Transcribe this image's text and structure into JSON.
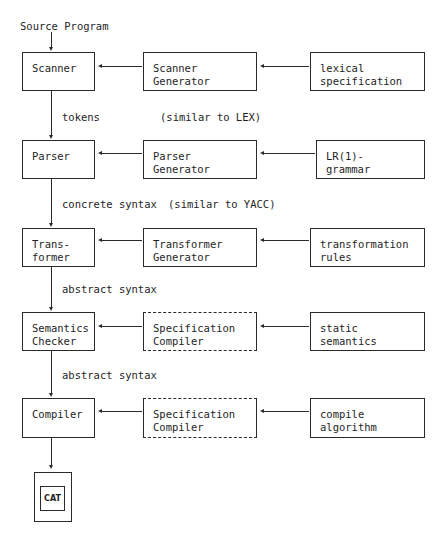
{
  "diagram": {
    "input_label": "Source Program",
    "rows": [
      {
        "stage": "Scanner",
        "generator": "Scanner\nGenerator",
        "generator_style": "solid",
        "spec": "lexical\nspecification",
        "edge_label": "tokens",
        "note": "(similar to LEX)"
      },
      {
        "stage": "Parser",
        "generator": "Parser\nGenerator",
        "generator_style": "solid",
        "spec": "LR(1)-\ngrammar",
        "edge_label": "concrete syntax",
        "note": "(similar to YACC)"
      },
      {
        "stage": "Trans-\nformer",
        "generator": "Transformer\nGenerator",
        "generator_style": "solid",
        "spec": "transformation\nrules",
        "edge_label": "abstract syntax",
        "note": ""
      },
      {
        "stage": "Semantics\nChecker",
        "generator": "Specification\nCompiler",
        "generator_style": "dashed",
        "spec": "static\nsemantics",
        "edge_label": "abstract syntax",
        "note": ""
      },
      {
        "stage": "Compiler",
        "generator": "Specification\nCompiler",
        "generator_style": "dashed",
        "spec": "compile\nalgorithm",
        "edge_label": "",
        "note": ""
      }
    ],
    "output": {
      "label": "CAT"
    },
    "colors": {
      "line": "#2a2a2a",
      "text": "#1e1e1e",
      "background": "#ffffff"
    }
  }
}
